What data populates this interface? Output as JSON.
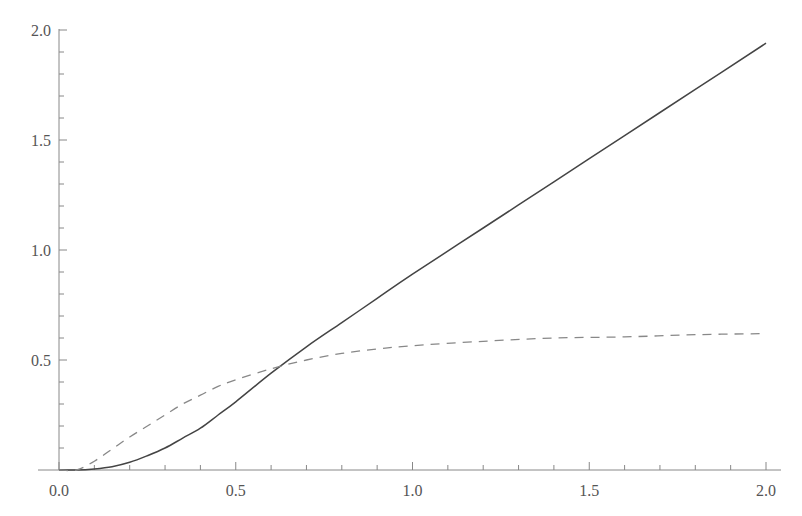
{
  "chart_data": {
    "type": "line",
    "title": "",
    "xlabel": "",
    "ylabel": "",
    "xlim": [
      0.0,
      2.0
    ],
    "ylim": [
      0.0,
      2.0
    ],
    "grid": false,
    "legend": null,
    "x_ticks": {
      "major": [
        0.0,
        0.5,
        1.0,
        1.5,
        2.0
      ],
      "major_labels": [
        "0.0",
        "0.5",
        "1.0",
        "1.5",
        "2.0"
      ],
      "minor_step": 0.1
    },
    "y_ticks": {
      "major": [
        0.5,
        1.0,
        1.5,
        2.0
      ],
      "major_labels": [
        "0.5",
        "1.0",
        "1.5",
        "2.0"
      ],
      "minor_step": 0.1
    },
    "series": [
      {
        "name": "solid",
        "style": "solid",
        "color": "#444444",
        "x": [
          0.0,
          0.05,
          0.1,
          0.15,
          0.2,
          0.25,
          0.3,
          0.35,
          0.4,
          0.45,
          0.5,
          0.6,
          0.7,
          0.8,
          0.9,
          1.0,
          1.2,
          1.4,
          1.6,
          1.8,
          2.0
        ],
        "values": [
          0.0,
          0.0,
          0.005,
          0.015,
          0.035,
          0.065,
          0.1,
          0.145,
          0.19,
          0.25,
          0.31,
          0.44,
          0.56,
          0.67,
          0.78,
          0.89,
          1.1,
          1.31,
          1.52,
          1.73,
          1.94
        ]
      },
      {
        "name": "dashed",
        "style": "dashed",
        "color": "#888888",
        "x": [
          0.0,
          0.05,
          0.1,
          0.15,
          0.2,
          0.25,
          0.3,
          0.35,
          0.4,
          0.45,
          0.5,
          0.6,
          0.7,
          0.8,
          0.9,
          1.0,
          1.2,
          1.4,
          1.6,
          1.8,
          2.0
        ],
        "values": [
          0.0,
          0.0,
          0.04,
          0.095,
          0.15,
          0.2,
          0.25,
          0.3,
          0.34,
          0.38,
          0.41,
          0.46,
          0.5,
          0.53,
          0.55,
          0.565,
          0.585,
          0.6,
          0.605,
          0.615,
          0.62
        ]
      }
    ]
  },
  "colors": {
    "axis": "#888888",
    "solid_line": "#444444",
    "dashed_line": "#888888",
    "background": "#ffffff"
  }
}
